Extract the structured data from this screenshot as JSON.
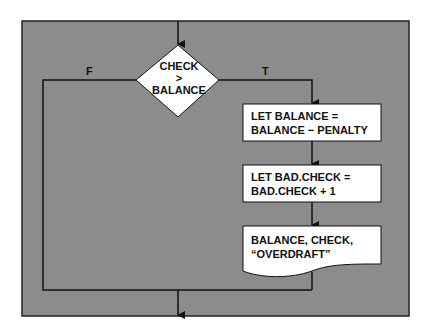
{
  "colors": {
    "frame_bg": "#8c8c8c",
    "frame_border": "#222222",
    "shape_fill": "#ffffff",
    "line": "#111111"
  },
  "decision": {
    "lines": [
      "CHECK",
      ">",
      "BALANCE"
    ],
    "false_label": "F",
    "true_label": "T"
  },
  "process_1": {
    "lines": [
      "LET BALANCE =",
      "BALANCE − PENALTY"
    ]
  },
  "process_2": {
    "lines": [
      "LET BAD.CHECK =",
      "BAD.CHECK + 1"
    ]
  },
  "output": {
    "lines": [
      "BALANCE, CHECK,",
      "“OVERDRAFT”"
    ]
  }
}
